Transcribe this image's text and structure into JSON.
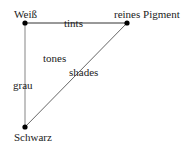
{
  "diagram": {
    "nodes": [
      {
        "id": "weiss",
        "label": "Weiß",
        "x": 25,
        "y": 23
      },
      {
        "id": "pigment",
        "label": "reines Pigment",
        "x": 127,
        "y": 23
      },
      {
        "id": "schwarz",
        "label": "Schwarz",
        "x": 25,
        "y": 127
      }
    ],
    "edges": [
      {
        "from": "weiss",
        "to": "pigment",
        "label": "tints",
        "color": "#333333"
      },
      {
        "from": "weiss",
        "to": "schwarz",
        "label": "grau",
        "color": "#999999"
      },
      {
        "from": "schwarz",
        "to": "pigment",
        "label": "shades",
        "color": "#555555"
      }
    ],
    "interior_label": "tones",
    "colors": {
      "node": "#000000",
      "text": "#222222",
      "background": "#ffffff"
    }
  }
}
